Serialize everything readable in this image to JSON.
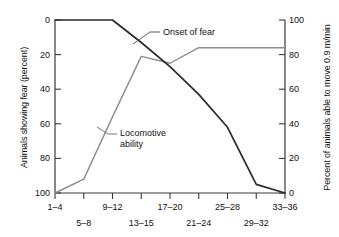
{
  "chart_data": {
    "type": "line",
    "title": "",
    "xlabel": "",
    "categories": [
      "1–4",
      "5–8",
      "9–12",
      "13–15",
      "17–20",
      "21–24",
      "25–28",
      "29–32",
      "33–36"
    ],
    "x_tick_rows": {
      "row1": [
        "1–4",
        "9–12",
        "17–20",
        "25–28",
        "33–36"
      ],
      "row2": [
        "5–8",
        "13–15",
        "21–24",
        "29–32"
      ]
    },
    "axes": {
      "left": {
        "label": "Animals showing fear (percent)",
        "ticks": [
          "0",
          "20",
          "40",
          "60",
          "80",
          "100"
        ],
        "tick_values": [
          0,
          20,
          40,
          60,
          80,
          100
        ],
        "range": [
          0,
          100
        ],
        "inverted": true
      },
      "right": {
        "label": "Percent of animals able to move 0.9 m/min",
        "ticks": [
          "100",
          "80",
          "60",
          "40",
          "20",
          "0"
        ],
        "tick_values": [
          100,
          80,
          60,
          40,
          20,
          0
        ],
        "range": [
          0,
          100
        ],
        "inverted": false
      }
    },
    "grid": false,
    "legend_position": "inline-annotations",
    "series": [
      {
        "name": "Onset of fear",
        "axis": "left",
        "color": "#2a2a2a",
        "values": [
          0,
          0,
          0,
          13,
          27,
          43,
          62,
          95,
          100
        ]
      },
      {
        "name": "Locomotive ability",
        "axis": "right",
        "color": "#8c8c8c",
        "values": [
          0,
          8,
          44,
          79,
          75,
          84,
          84,
          84,
          84
        ]
      }
    ],
    "annotations": [
      {
        "text": "Onset of fear",
        "series": "Onset of fear"
      },
      {
        "text": "Locomotive",
        "text2": "ability",
        "series": "Locomotive ability"
      }
    ]
  },
  "labels": {
    "y_left_title": "Animals showing fear (percent)",
    "y_right_title": "Percent of animals able to move 0.9 m/min",
    "onset_of_fear": "Onset of fear",
    "locomotive_line1": "Locomotive",
    "locomotive_line2": "ability",
    "left_ticks": [
      "0",
      "20",
      "40",
      "60",
      "80",
      "100"
    ],
    "right_ticks": [
      "100",
      "80",
      "60",
      "40",
      "20",
      "0"
    ],
    "x_row1": [
      "1–4",
      "9–12",
      "17–20",
      "25–28",
      "33–36"
    ],
    "x_row2": [
      "5–8",
      "13–15",
      "21–24",
      "29–32"
    ]
  },
  "colors": {
    "axis": "#3a3a3a",
    "dark_series": "#2a2a2a",
    "gray_series": "#8c8c8c",
    "background": "#ffffff",
    "text": "#111111"
  }
}
